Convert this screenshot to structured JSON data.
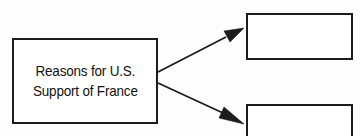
{
  "diagram": {
    "type": "cause-and-effect-graphic-organizer",
    "background_color": "#fdfdfd",
    "line_color": "#1c1c1c",
    "box_fill_color": "#ffffff",
    "cause_box": {
      "label_line_1": "Reasons for U.S.",
      "label_line_2": "Support of France",
      "text": "Reasons for U.S.\nSupport of France"
    },
    "effect_boxes": [
      {
        "position": "top-right",
        "text": ""
      },
      {
        "position": "bottom-right",
        "text": ""
      }
    ],
    "connectors": [
      {
        "name": "arrow-to-top-box",
        "from": "cause-box",
        "to": "effect-box-top"
      },
      {
        "name": "arrow-to-bottom-box",
        "from": "cause-box",
        "to": "effect-box-bottom"
      }
    ]
  }
}
